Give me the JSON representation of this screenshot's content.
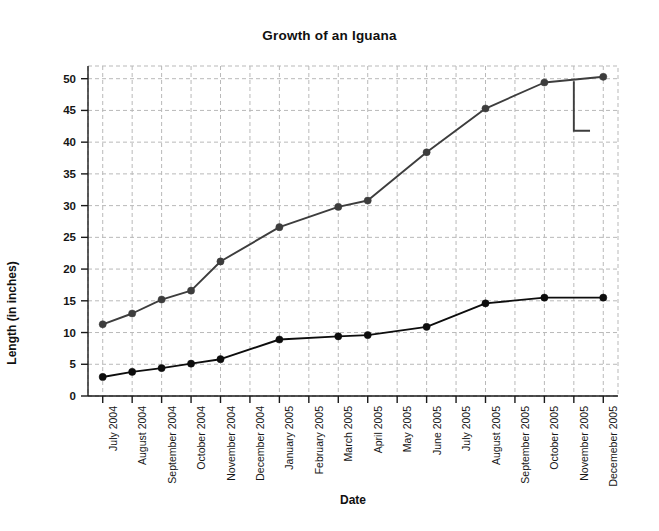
{
  "chart_data": {
    "type": "line",
    "title": "Growth of an Iguana",
    "xlabel": "Date",
    "ylabel": "Length (in inches)",
    "categories": [
      "July 2004",
      "August 2004",
      "September 2004",
      "October 2004",
      "November 2004",
      "December 2004",
      "January 2005",
      "February 2005",
      "March 2005",
      "April 2005",
      "May 2005",
      "June 2005",
      "July 2005",
      "August 2005",
      "September 2005",
      "October 2005",
      "November 2005",
      "Decemeber 2005"
    ],
    "ylim": [
      0,
      52
    ],
    "yticks": [
      0,
      5,
      10,
      15,
      20,
      25,
      30,
      35,
      40,
      45,
      50
    ],
    "grid": true,
    "legend": "none",
    "series": [
      {
        "name": "upper-series",
        "color": "#3d3d3d",
        "marker": "filled-circle",
        "values": [
          11.3,
          13.0,
          15.2,
          16.6,
          21.2,
          null,
          26.6,
          null,
          29.8,
          30.8,
          null,
          38.4,
          null,
          45.3,
          null,
          49.4,
          null,
          50.3
        ],
        "marker_indices": [
          0,
          1,
          2,
          3,
          4,
          6,
          8,
          9,
          11,
          13,
          15,
          17
        ]
      },
      {
        "name": "lower-series",
        "color": "#0d0d0d",
        "marker": "filled-circle",
        "values": [
          3.0,
          3.8,
          4.4,
          5.1,
          5.8,
          null,
          8.9,
          null,
          9.4,
          9.6,
          null,
          10.9,
          null,
          14.6,
          null,
          15.5,
          null,
          15.5
        ],
        "marker_indices": [
          0,
          1,
          2,
          3,
          4,
          6,
          8,
          9,
          11,
          13,
          15,
          17
        ]
      }
    ],
    "artifact": {
      "name": "vertical-drop-artifact",
      "description": "vertical stroke descending at November 2005 with short horizontal segment",
      "x_category": "November 2005",
      "y_top": 49.6,
      "y_bottom": 41.8,
      "horizontal_end_x_fraction": 0.55
    }
  }
}
